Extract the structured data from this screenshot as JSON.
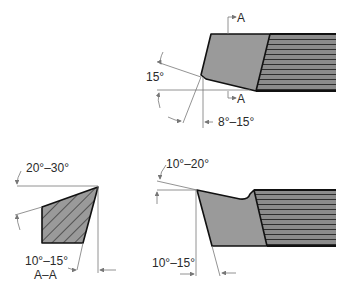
{
  "figure": {
    "type": "single-point cutting tool geometry",
    "views": [
      {
        "name": "top-view",
        "labels": {
          "section_marker_top": "A",
          "section_marker_bottom": "A",
          "side_angle": "15°",
          "end_relief": "8°–15°"
        }
      },
      {
        "name": "section-a-a",
        "labels": {
          "rake_angle": "20°–30°",
          "clearance_angle": "10°–15°",
          "section_title": "A–A"
        }
      },
      {
        "name": "side-view",
        "labels": {
          "back_rake": "10°–20°",
          "front_clearance": "10°–15°"
        }
      }
    ]
  },
  "colors": {
    "tool_fill": "#9a9a9a",
    "outline": "#111111",
    "dim_line": "#777777",
    "shank_stripe": "#3a3a3a"
  }
}
